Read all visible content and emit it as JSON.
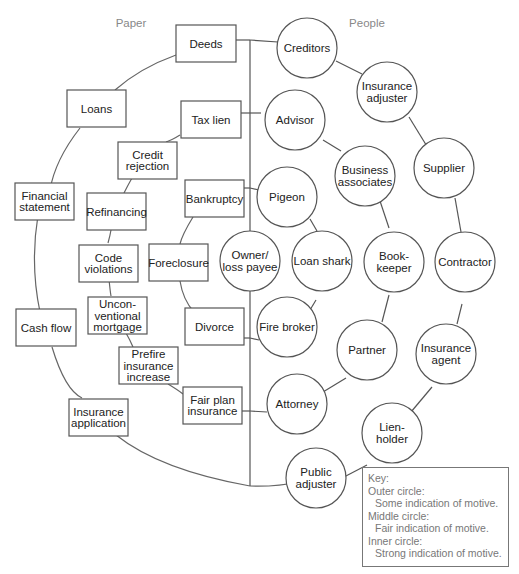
{
  "headers": {
    "left": "Paper",
    "right": "People"
  },
  "paper": {
    "outer": [
      [
        "Deeds"
      ],
      [
        "Loans"
      ],
      [
        "Financial",
        "statement"
      ],
      [
        "Cash flow"
      ],
      [
        "Insurance",
        "application"
      ]
    ],
    "middle": [
      [
        "Tax lien"
      ],
      [
        "Credit",
        "rejection"
      ],
      [
        "Refinancing"
      ],
      [
        "Code",
        "violations"
      ],
      [
        "Uncon-",
        "ventional",
        "mortgage"
      ],
      [
        "Prefire",
        "insurance",
        "increase"
      ],
      [
        "Fair plan",
        "insurance"
      ]
    ],
    "inner": [
      [
        "Bankruptcy"
      ],
      [
        "Foreclosure"
      ],
      [
        "Divorce"
      ]
    ]
  },
  "people": {
    "center": [
      "Owner/",
      "loss payee"
    ],
    "outer": [
      [
        "Creditors"
      ],
      [
        "Insurance",
        "adjuster"
      ],
      [
        "Supplier"
      ],
      [
        "Contractor"
      ],
      [
        "Insurance",
        "agent"
      ],
      [
        "Lien-",
        "holder"
      ],
      [
        "Public",
        "adjuster"
      ]
    ],
    "middle": [
      [
        "Advisor"
      ],
      [
        "Business",
        "associates"
      ],
      [
        "Book-",
        "keeper"
      ],
      [
        "Partner"
      ],
      [
        "Attorney"
      ]
    ],
    "inner": [
      [
        "Pigeon"
      ],
      [
        "Loan shark"
      ],
      [
        "Fire broker"
      ]
    ]
  },
  "key": {
    "title": "Key:",
    "outer_label": "Outer circle:",
    "outer_desc": "Some indication of motive.",
    "middle_label": "Middle circle:",
    "middle_desc": "Fair indication of motive.",
    "inner_label": "Inner circle:",
    "inner_desc": "Strong indication of motive."
  }
}
